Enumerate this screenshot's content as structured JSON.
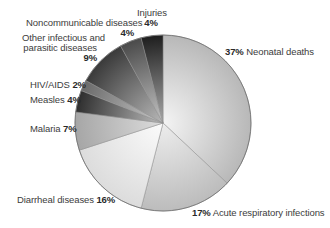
{
  "chart_data": {
    "type": "pie",
    "title": "",
    "start_angle_deg": 0,
    "direction": "clockwise",
    "slices": [
      {
        "label": "Neonatal deaths",
        "value": 37,
        "pct": "37%",
        "color_center": "#f4f4f4",
        "color_edge": "#b8b8b8"
      },
      {
        "label": "Acute respiratory infections",
        "value": 17,
        "pct": "17%",
        "color_center": "#ededed",
        "color_edge": "#bcbcbc"
      },
      {
        "label": "Diarrheal diseases",
        "value": 16,
        "pct": "16%",
        "color_center": "#fbfbfb",
        "color_edge": "#dcdcdc"
      },
      {
        "label": "Malaria",
        "value": 7,
        "pct": "7%",
        "color_center": "#dcdcdc",
        "color_edge": "#a6a6a6"
      },
      {
        "label": "Measles",
        "value": 4,
        "pct": "4%",
        "color_center": "#bcbcbc",
        "color_edge": "#2e2e2e"
      },
      {
        "label": "HIV/AIDS",
        "value": 2,
        "pct": "2%",
        "color_center": "#c8c8c8",
        "color_edge": "#6a6a6a"
      },
      {
        "label": "Other infectious and parasitic diseases",
        "value": 9,
        "pct": "9%",
        "color_center": "#b8b8b8",
        "color_edge": "#3a3a3a"
      },
      {
        "label": "Noncommunicable diseases",
        "value": 4,
        "pct": "4%",
        "color_center": "#c4c4c4",
        "color_edge": "#4a4a4a"
      },
      {
        "label": "Injuries",
        "value": 4,
        "pct": "4%",
        "color_center": "#a8a8a8",
        "color_edge": "#1e1e1e"
      }
    ],
    "legend": "none (direct labels)"
  },
  "labels": {
    "neonatal": {
      "pct": "37%",
      "text": "Neonatal deaths"
    },
    "acute": {
      "pct": "17%",
      "text": "Acute respiratory infections"
    },
    "diarrheal": {
      "text": "Diarrheal diseases",
      "pct": "16%"
    },
    "malaria": {
      "text": "Malaria",
      "pct": "7%"
    },
    "measles": {
      "text": "Measles",
      "pct": "4%"
    },
    "hiv": {
      "text": "HIV/AIDS",
      "pct": "2%"
    },
    "other": {
      "line1": "Other infectious and",
      "line2": "parasitic diseases",
      "pct": "9%"
    },
    "noncomm": {
      "text": "Noncommunicable diseases",
      "pct": "4%"
    },
    "injuries": {
      "text": "Injuries",
      "pct": "4%"
    }
  },
  "geometry": {
    "cx": 163,
    "cy": 123,
    "r": 88
  }
}
